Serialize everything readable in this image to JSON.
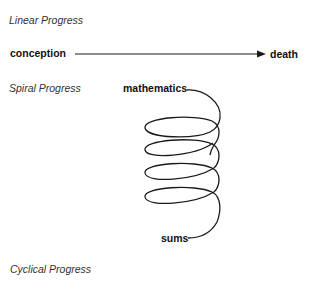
{
  "linear": {
    "title": "Linear Progress",
    "start_label": "conception",
    "end_label": "death"
  },
  "spiral": {
    "title": "Spiral Progress",
    "top_label": "mathematics",
    "bottom_label": "sums",
    "loops": 4
  },
  "cyclical": {
    "title": "Cyclical Progress"
  },
  "colors": {
    "stroke": "#1a1a1a",
    "heading": "#333333"
  }
}
